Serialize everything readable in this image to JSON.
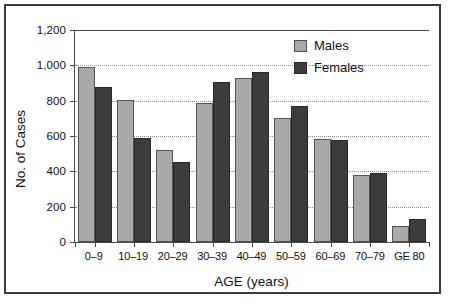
{
  "chart_data": {
    "type": "bar",
    "title": "",
    "xlabel": "AGE (years)",
    "ylabel": "No. of Cases",
    "categories": [
      "0–9",
      "10–19",
      "20–29",
      "30–39",
      "40–49",
      "50–59",
      "60–69",
      "70–79",
      "GE 80"
    ],
    "series": [
      {
        "name": "Males",
        "color": "#a9a9a9",
        "values": [
          990,
          805,
          520,
          785,
          930,
          700,
          585,
          378,
          90
        ]
      },
      {
        "name": "Females",
        "color": "#3c3c3c",
        "values": [
          875,
          588,
          452,
          908,
          965,
          770,
          580,
          390,
          132
        ]
      }
    ],
    "ylim": [
      0,
      1200
    ],
    "yticks": [
      0,
      200,
      400,
      600,
      800,
      1000,
      1200
    ],
    "ytick_labels": [
      "0",
      "200",
      "400",
      "600",
      "800",
      "1,000",
      "1,200"
    ],
    "grid": "horizontal-dotted",
    "legend_position": "top-right",
    "bar_mode": "grouped"
  },
  "legend": {
    "items": [
      {
        "label": "Males"
      },
      {
        "label": "Females"
      }
    ]
  }
}
